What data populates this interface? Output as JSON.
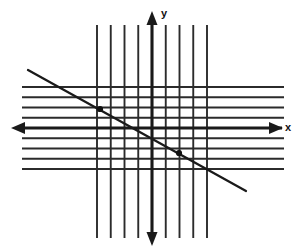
{
  "figure": {
    "background_color": "#ffffff",
    "grid_color": "#2b2b2b",
    "axis_color": "#1a1a1a",
    "line_color": "#1a1a1a",
    "point_color": "#111111"
  },
  "axes": {
    "x_label": "x",
    "y_label": "y",
    "x_axis_name": "horizontal-axis",
    "y_axis_name": "vertical-axis",
    "x_arrow_left_icon": "arrow-left-icon",
    "x_arrow_right_icon": "arrow-right-icon",
    "y_arrow_up_icon": "arrow-up-icon",
    "y_arrow_down_icon": "arrow-down-icon"
  },
  "chart_data": {
    "type": "line",
    "xlabel": "x",
    "ylabel": "y",
    "grid": true,
    "legend": "none",
    "xlim": [
      -4,
      4
    ],
    "ylim": [
      -4,
      4
    ],
    "x_gridlines": [
      -4,
      -3,
      -2,
      -1,
      0,
      1,
      2,
      3,
      4
    ],
    "y_gridlines": [
      -4,
      -3,
      -2,
      -1,
      0,
      1,
      2,
      3,
      4
    ],
    "series": [
      {
        "name": "line",
        "slope": -0.555,
        "y_intercept": -0.15,
        "x": [
          -5.0,
          4.1
        ],
        "y": [
          2.6,
          -2.4
        ],
        "marked_points": [
          {
            "x": -2.0,
            "y": 1.0,
            "label": ""
          },
          {
            "x": 1.5,
            "y": -1.0,
            "label": ""
          }
        ]
      }
    ]
  },
  "geometry": {
    "grid_vertical_x": [
      97,
      110.75,
      124.5,
      138.25,
      152,
      165.75,
      179.5,
      193.25,
      207
    ],
    "grid_vertical_top": 25,
    "grid_vertical_bottom": 238,
    "grid_horizontal_y": [
      87,
      97.25,
      107.5,
      117.75,
      128,
      138.25,
      148.5,
      158.75,
      169
    ],
    "grid_horizontal_left": 22,
    "grid_horizontal_right": 284,
    "x_axis_y": 128,
    "y_axis_x": 152,
    "line_start": {
      "x": 28,
      "y": 70
    },
    "line_end": {
      "x": 246,
      "y": 191
    },
    "point_a": {
      "x": 100,
      "y": 109
    },
    "point_b": {
      "x": 179,
      "y": 153
    }
  }
}
